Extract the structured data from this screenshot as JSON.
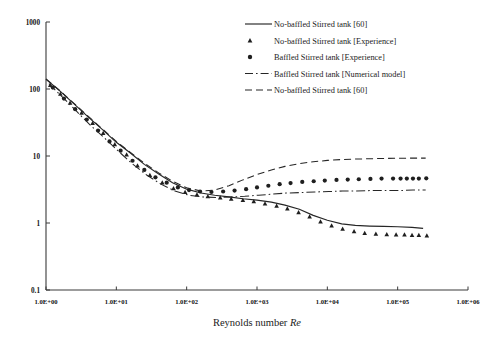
{
  "figure": {
    "background_color": "#ffffff",
    "ink_color": "#262626"
  },
  "chart_data": {
    "type": "line",
    "title": "",
    "subtitle": "",
    "xlabel": "Reynolds number Re",
    "xlabel_plain": "Reynolds number ",
    "xlabel_italic": "Re",
    "ylabel": "",
    "xscale": "log",
    "yscale": "log",
    "xlim": [
      1,
      1000000
    ],
    "ylim": [
      0.1,
      1000
    ],
    "grid": false,
    "legend_position": "top-right",
    "x_tick_labels": [
      "1.0E+00",
      "1.0E+01",
      "1.0E+02",
      "1.0E+03",
      "1.0E+04",
      "1.0E+05",
      "1.0E+06"
    ],
    "x_tick_values": [
      1,
      10,
      100,
      1000,
      10000,
      100000,
      1000000
    ],
    "y_tick_labels": [
      "1000",
      "100",
      "10",
      "1",
      "0.1"
    ],
    "y_tick_values": [
      1000,
      100,
      10,
      1,
      0.1
    ],
    "series": [
      {
        "name": "No-baffled Stirred tank [60]",
        "style": "solid-line",
        "legend_marker": "line-solid",
        "points": [
          {
            "x": 1.0,
            "y": 140
          },
          {
            "x": 1.6,
            "y": 92
          },
          {
            "x": 2.5,
            "y": 60
          },
          {
            "x": 4.0,
            "y": 38
          },
          {
            "x": 6.3,
            "y": 25
          },
          {
            "x": 10,
            "y": 16
          },
          {
            "x": 16,
            "y": 11
          },
          {
            "x": 25,
            "y": 7.5
          },
          {
            "x": 40,
            "y": 5.4
          },
          {
            "x": 63,
            "y": 4.0
          },
          {
            "x": 100,
            "y": 3.2
          },
          {
            "x": 160,
            "y": 2.8
          },
          {
            "x": 250,
            "y": 2.6
          },
          {
            "x": 400,
            "y": 2.45
          },
          {
            "x": 630,
            "y": 2.3
          },
          {
            "x": 1000,
            "y": 2.2
          },
          {
            "x": 1600,
            "y": 2.05
          },
          {
            "x": 2500,
            "y": 1.85
          },
          {
            "x": 4000,
            "y": 1.6
          },
          {
            "x": 6300,
            "y": 1.3
          },
          {
            "x": 10000,
            "y": 1.1
          },
          {
            "x": 16000,
            "y": 0.97
          },
          {
            "x": 25000,
            "y": 0.92
          },
          {
            "x": 40000,
            "y": 0.9
          },
          {
            "x": 63000,
            "y": 0.89
          },
          {
            "x": 100000,
            "y": 0.88
          },
          {
            "x": 160000,
            "y": 0.86
          },
          {
            "x": 230000,
            "y": 0.83
          }
        ]
      },
      {
        "name": "No-baffled Stirred tank [Experience]",
        "style": "triangle-markers",
        "legend_marker": "triangle",
        "points": [
          {
            "x": 1.15,
            "y": 115
          },
          {
            "x": 1.6,
            "y": 85
          },
          {
            "x": 2.2,
            "y": 62
          },
          {
            "x": 3.2,
            "y": 44
          },
          {
            "x": 4.6,
            "y": 31
          },
          {
            "x": 6.5,
            "y": 22
          },
          {
            "x": 9.5,
            "y": 15
          },
          {
            "x": 14,
            "y": 10.5
          },
          {
            "x": 20,
            "y": 7.2
          },
          {
            "x": 30,
            "y": 5.2
          },
          {
            "x": 45,
            "y": 4.0
          },
          {
            "x": 65,
            "y": 3.3
          },
          {
            "x": 95,
            "y": 2.9
          },
          {
            "x": 140,
            "y": 2.65
          },
          {
            "x": 200,
            "y": 2.5
          },
          {
            "x": 300,
            "y": 2.4
          },
          {
            "x": 430,
            "y": 2.3
          },
          {
            "x": 630,
            "y": 2.2
          },
          {
            "x": 900,
            "y": 2.1
          },
          {
            "x": 1300,
            "y": 1.95
          },
          {
            "x": 1900,
            "y": 1.8
          },
          {
            "x": 2700,
            "y": 1.65
          },
          {
            "x": 3900,
            "y": 1.45
          },
          {
            "x": 5600,
            "y": 1.25
          },
          {
            "x": 8000,
            "y": 1.05
          },
          {
            "x": 11500,
            "y": 0.92
          },
          {
            "x": 16500,
            "y": 0.82
          },
          {
            "x": 24000,
            "y": 0.75
          },
          {
            "x": 34000,
            "y": 0.71
          },
          {
            "x": 49000,
            "y": 0.69
          },
          {
            "x": 70000,
            "y": 0.68
          },
          {
            "x": 95000,
            "y": 0.67
          },
          {
            "x": 125000,
            "y": 0.67
          },
          {
            "x": 160000,
            "y": 0.66
          },
          {
            "x": 200000,
            "y": 0.66
          },
          {
            "x": 260000,
            "y": 0.65
          }
        ]
      },
      {
        "name": "Baffled Stirred tank [Experience]",
        "style": "circle-markers",
        "legend_marker": "circle",
        "points": [
          {
            "x": 1.25,
            "y": 105
          },
          {
            "x": 1.8,
            "y": 72
          },
          {
            "x": 2.6,
            "y": 50
          },
          {
            "x": 3.8,
            "y": 35
          },
          {
            "x": 5.5,
            "y": 24
          },
          {
            "x": 8.0,
            "y": 16.5
          },
          {
            "x": 11.5,
            "y": 12
          },
          {
            "x": 17,
            "y": 8.5
          },
          {
            "x": 25,
            "y": 6.2
          },
          {
            "x": 36,
            "y": 4.8
          },
          {
            "x": 52,
            "y": 4.0
          },
          {
            "x": 75,
            "y": 3.4
          },
          {
            "x": 108,
            "y": 3.1
          },
          {
            "x": 155,
            "y": 2.95
          },
          {
            "x": 225,
            "y": 2.9
          },
          {
            "x": 330,
            "y": 2.95
          },
          {
            "x": 480,
            "y": 3.05
          },
          {
            "x": 700,
            "y": 3.2
          },
          {
            "x": 1000,
            "y": 3.4
          },
          {
            "x": 1450,
            "y": 3.6
          },
          {
            "x": 2100,
            "y": 3.8
          },
          {
            "x": 3000,
            "y": 3.95
          },
          {
            "x": 4400,
            "y": 4.1
          },
          {
            "x": 6400,
            "y": 4.2
          },
          {
            "x": 9200,
            "y": 4.3
          },
          {
            "x": 13500,
            "y": 4.4
          },
          {
            "x": 19500,
            "y": 4.45
          },
          {
            "x": 28000,
            "y": 4.5
          },
          {
            "x": 41000,
            "y": 4.55
          },
          {
            "x": 59000,
            "y": 4.6
          },
          {
            "x": 86000,
            "y": 4.6
          },
          {
            "x": 110000,
            "y": 4.6
          },
          {
            "x": 135000,
            "y": 4.6
          },
          {
            "x": 165000,
            "y": 4.6
          },
          {
            "x": 200000,
            "y": 4.6
          },
          {
            "x": 255000,
            "y": 4.65
          }
        ]
      },
      {
        "name": "Baffled Stirred tank [Numerical model]",
        "style": "dash-dot-line",
        "legend_marker": "line-dash-dot",
        "points": [
          {
            "x": 1.1,
            "y": 120
          },
          {
            "x": 1.8,
            "y": 72
          },
          {
            "x": 2.8,
            "y": 45
          },
          {
            "x": 4.4,
            "y": 28
          },
          {
            "x": 7.0,
            "y": 18
          },
          {
            "x": 11,
            "y": 11.5
          },
          {
            "x": 17,
            "y": 7.6
          },
          {
            "x": 27,
            "y": 5.2
          },
          {
            "x": 43,
            "y": 3.8
          },
          {
            "x": 68,
            "y": 3.0
          },
          {
            "x": 107,
            "y": 2.6
          },
          {
            "x": 170,
            "y": 2.45
          },
          {
            "x": 270,
            "y": 2.4
          },
          {
            "x": 420,
            "y": 2.45
          },
          {
            "x": 670,
            "y": 2.5
          },
          {
            "x": 1050,
            "y": 2.6
          },
          {
            "x": 1700,
            "y": 2.7
          },
          {
            "x": 2600,
            "y": 2.8
          },
          {
            "x": 4200,
            "y": 2.85
          },
          {
            "x": 6600,
            "y": 2.9
          },
          {
            "x": 10500,
            "y": 2.95
          },
          {
            "x": 16500,
            "y": 3.0
          },
          {
            "x": 26000,
            "y": 3.0
          },
          {
            "x": 42000,
            "y": 3.05
          },
          {
            "x": 66000,
            "y": 3.05
          },
          {
            "x": 105000,
            "y": 3.05
          },
          {
            "x": 165000,
            "y": 3.1
          },
          {
            "x": 250000,
            "y": 3.1
          }
        ]
      },
      {
        "name": "No-baffled Stirred tank [60]",
        "style": "dashed-line",
        "legend_marker": "line-dashed",
        "points": [
          {
            "x": 1.0,
            "y": 142
          },
          {
            "x": 1.6,
            "y": 93
          },
          {
            "x": 2.5,
            "y": 61
          },
          {
            "x": 4.0,
            "y": 39
          },
          {
            "x": 6.3,
            "y": 25.5
          },
          {
            "x": 10,
            "y": 16.5
          },
          {
            "x": 16,
            "y": 11.2
          },
          {
            "x": 25,
            "y": 7.8
          },
          {
            "x": 40,
            "y": 5.6
          },
          {
            "x": 63,
            "y": 4.2
          },
          {
            "x": 100,
            "y": 3.35
          },
          {
            "x": 160,
            "y": 3.0
          },
          {
            "x": 250,
            "y": 3.1
          },
          {
            "x": 400,
            "y": 3.6
          },
          {
            "x": 630,
            "y": 4.4
          },
          {
            "x": 1000,
            "y": 5.3
          },
          {
            "x": 1600,
            "y": 6.2
          },
          {
            "x": 2500,
            "y": 7.0
          },
          {
            "x": 4000,
            "y": 7.7
          },
          {
            "x": 6300,
            "y": 8.2
          },
          {
            "x": 10000,
            "y": 8.6
          },
          {
            "x": 16000,
            "y": 8.85
          },
          {
            "x": 25000,
            "y": 9.0
          },
          {
            "x": 40000,
            "y": 9.1
          },
          {
            "x": 63000,
            "y": 9.2
          },
          {
            "x": 100000,
            "y": 9.25
          },
          {
            "x": 160000,
            "y": 9.3
          },
          {
            "x": 250000,
            "y": 9.3
          }
        ]
      }
    ]
  },
  "legend": {
    "entries": [
      {
        "label": "No-baffled Stirred tank [60]",
        "marker": "line-solid"
      },
      {
        "label": "No-baffled Stirred tank [Experience]",
        "marker": "triangle"
      },
      {
        "label": "Baffled Stirred tank [Experience]",
        "marker": "circle"
      },
      {
        "label": "Baffled Stirred tank [Numerical model]",
        "marker": "line-dash-dot"
      },
      {
        "label": "No-baffled Stirred tank [60]",
        "marker": "line-dashed"
      }
    ]
  }
}
